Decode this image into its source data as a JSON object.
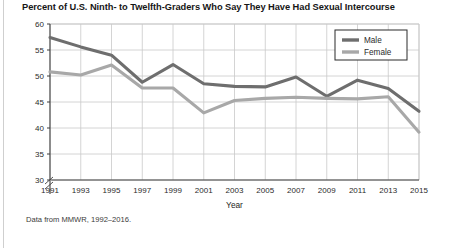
{
  "figure": {
    "title": "Percent of U.S. Ninth- to Twelfth-Graders Who Say They Have Had Sexual Intercourse",
    "source_note": "Data from MMWR, 1992–2016."
  },
  "chart_data": {
    "type": "line",
    "title": "Percent of U.S. Ninth- to Twelfth-Graders Who Say They Have Had Sexual Intercourse",
    "xlabel": "Year",
    "ylabel": "",
    "categories": [
      "1991",
      "1993",
      "1995",
      "1997",
      "1999",
      "2001",
      "2003",
      "2005",
      "2007",
      "2009",
      "2011",
      "2013",
      "2015"
    ],
    "x": [
      1991,
      1993,
      1995,
      1997,
      1999,
      2001,
      2003,
      2005,
      2007,
      2009,
      2011,
      2013,
      2015
    ],
    "series": [
      {
        "name": "Male",
        "color": "#6e6e6e",
        "values": [
          57.4,
          55.6,
          54.0,
          48.8,
          52.2,
          48.5,
          48.0,
          47.9,
          49.8,
          46.1,
          49.2,
          47.6,
          43.2
        ]
      },
      {
        "name": "Female",
        "color": "#a8a8a8",
        "values": [
          50.8,
          50.2,
          52.1,
          47.7,
          47.7,
          42.9,
          45.3,
          45.7,
          45.9,
          45.7,
          45.6,
          46.0,
          39.2
        ]
      }
    ],
    "ylim": [
      30,
      60
    ],
    "yticks": [
      30,
      35,
      40,
      45,
      50,
      55,
      60
    ],
    "ytick_labels": [
      "30",
      "35",
      "40",
      "45",
      "50",
      "55",
      "60"
    ],
    "xlim": [
      1991,
      2015
    ],
    "grid": true,
    "axis_break": true,
    "legend_position": "top-right",
    "legend": [
      "Male",
      "Female"
    ]
  },
  "colors": {
    "male": "#6e6e6e",
    "female": "#a8a8a8",
    "grid": "#c9c9c9",
    "axis": "#3f3f3f",
    "text": "#1d1d1d",
    "rule": "#cfcfcf"
  }
}
